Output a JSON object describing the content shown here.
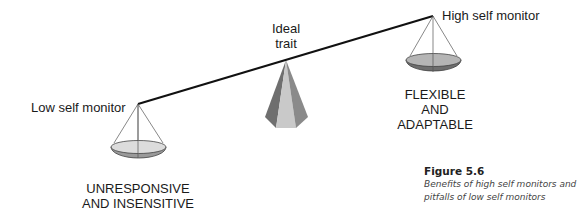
{
  "labels": {
    "ideal_line1": "Ideal",
    "ideal_line2": "trait",
    "high": "High self monitor",
    "low": "Low self monitor",
    "high_outcome_1": "FLEXIBLE",
    "high_outcome_2": "AND",
    "high_outcome_3": "ADAPTABLE",
    "low_outcome_1": "UNRESPONSIVE",
    "low_outcome_2": "AND INSENSITIVE"
  },
  "caption": {
    "title": "Figure 5.6",
    "text": "Benefits of high self monitors and pitfalls of low self monitors"
  },
  "colors": {
    "beam": "#111111",
    "pan_top": "#d6d6d6",
    "pan_bottom": "#8a8a8a",
    "pyramid_dark": "#7a7a7a",
    "pyramid_light": "#c4c4c4"
  }
}
